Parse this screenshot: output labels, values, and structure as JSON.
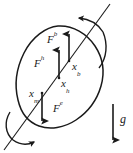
{
  "figure": {
    "type": "free-body-diagram",
    "background_color": "#ffffff",
    "stroke_color": "#1a1a1a",
    "labels": {
      "buoyancy_force": {
        "base": "F",
        "sup": "b"
      },
      "hydrodynamic_force": {
        "base": "F",
        "sup": "h"
      },
      "external_force": {
        "base": "F",
        "sup": "e"
      },
      "buoyancy_point": {
        "base": "x",
        "sub": "b"
      },
      "hydrodynamic_point": {
        "base": "x",
        "sub": "h"
      },
      "mass_center_point": {
        "base": "x",
        "sub": "m"
      },
      "gravity": {
        "base": "g",
        "sup": "",
        "sub": ""
      }
    }
  }
}
